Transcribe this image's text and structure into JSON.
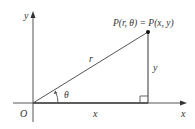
{
  "diagram": {
    "axes": {
      "x_label": "x",
      "y_label": "y",
      "origin_label": "O"
    },
    "point": {
      "label": "P(r, θ) = P(x, y)"
    },
    "segments": {
      "radius_label": "r",
      "horizontal_label": "x",
      "vertical_label": "y",
      "angle_label": "θ"
    },
    "colors": {
      "line": "#555555",
      "text": "#333333",
      "point": "#111111"
    }
  }
}
